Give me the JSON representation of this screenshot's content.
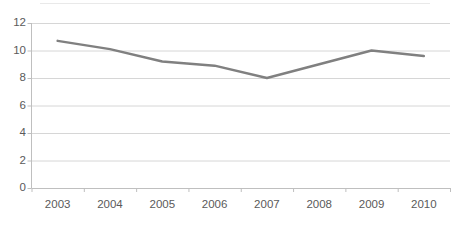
{
  "chart_data": {
    "type": "line",
    "title": "",
    "subtitle": "",
    "xlabel": "",
    "ylabel": "",
    "categories": [
      "2003",
      "2004",
      "2005",
      "2006",
      "2007",
      "2008",
      "2009",
      "2010"
    ],
    "values": [
      10.7,
      10.1,
      9.2,
      8.9,
      8.0,
      9.0,
      10.0,
      9.6
    ],
    "series": [
      {
        "name": "",
        "values": [
          10.7,
          10.1,
          9.2,
          8.9,
          8.0,
          9.0,
          10.0,
          9.6
        ]
      }
    ],
    "ylim": [
      0,
      12
    ],
    "yticks": [
      0,
      2,
      4,
      6,
      8,
      10,
      12
    ],
    "ytick_labels": [
      "0",
      "2",
      "4",
      "6",
      "8",
      "10",
      "12"
    ],
    "xtick_labels": [
      "2003",
      "2004",
      "2005",
      "2006",
      "2007",
      "2008",
      "2009",
      "2010"
    ],
    "grid": true,
    "grid_axis": "y",
    "legend": false,
    "legend_position": "none",
    "annotations": [],
    "markers": false,
    "line_color": "#808080",
    "line_width": 2.5,
    "grid_color": "#d6d6d6",
    "axis_color": "#bfbfbf",
    "text_color": "#5a5a5a",
    "background_color": "#ffffff"
  }
}
